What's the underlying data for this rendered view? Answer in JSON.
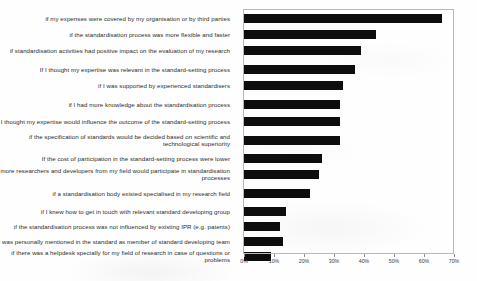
{
  "chart_data": {
    "type": "bar",
    "orientation": "horizontal",
    "title": "",
    "xlabel": "",
    "ylabel": "",
    "xlim": [
      0,
      70
    ],
    "grid": false,
    "legend": null,
    "tick_labels": [
      "0%",
      "10%",
      "20%",
      "30%",
      "40%",
      "50%",
      "60%",
      "70%"
    ],
    "tick_values": [
      0,
      10,
      20,
      30,
      40,
      50,
      60,
      70
    ],
    "bar_color": "#0d0d0d",
    "categories": [
      "if my expenses were covered by my organisation or by third parties",
      "if the standardisation process was more flexible and faster",
      "if standardisation activities had positive impact on the evaluation of my research",
      "If I thought my expertise was relevant in the standard-setting process",
      "if I was supported by experienced standardisers",
      "if I had more knowledge about the standardisation process",
      "if I thought my expertise would influence the outcome of the standard-setting process",
      "if the specification of standards would be decided based on scientific and technological superiority",
      "If the cost of participation in the standard-setting process were lower",
      "if more researchers and developers from my field would participate in standardisation processes",
      "if a standardisation body existed specialised in my research field",
      "if I knew how to get in touch with relevant standard developing group",
      "if the standardisation process was not influenced by existing IPR (e.g. patents)",
      "If I was personally mentioned in the standard as member of standard developing team",
      "if there was a helpdesk specially for my field of research in case of questions or problems"
    ],
    "values": [
      66,
      44,
      39,
      37,
      33,
      32,
      32,
      32,
      26,
      25,
      22,
      14,
      12,
      13,
      9
    ]
  }
}
